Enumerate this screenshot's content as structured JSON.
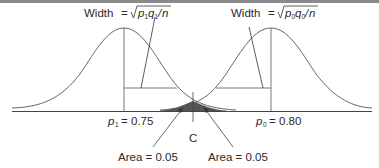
{
  "diagram": {
    "type": "two overlapping normal distributions (hypothesis test)",
    "left_curve": {
      "width_label": {
        "prefix": "Width",
        "equals": "=",
        "radical_var1": "p",
        "sub1": "1",
        "radical_var2": "q",
        "sub2": "1",
        "slash": "/",
        "denom": "n"
      },
      "mean_label": {
        "var": "p",
        "sub": "1",
        "equals": "=",
        "value": "0.75"
      }
    },
    "right_curve": {
      "width_label": {
        "prefix": "Width",
        "equals": "=",
        "radical_var1": "p",
        "sub1": "0",
        "radical_var2": "q",
        "sub2": "0",
        "slash": "/",
        "denom": "n"
      },
      "mean_label": {
        "var": "p",
        "sub": "0",
        "equals": "=",
        "value": "0.80"
      }
    },
    "critical_value_label": "C",
    "area_labels": [
      {
        "text": "Area = 0.05"
      },
      {
        "text": "Area = 0.05"
      }
    ],
    "colors": {
      "curve": "#555555",
      "axis": "#444444",
      "shade": "#555555",
      "top_rule": "#7a7a7a"
    }
  }
}
